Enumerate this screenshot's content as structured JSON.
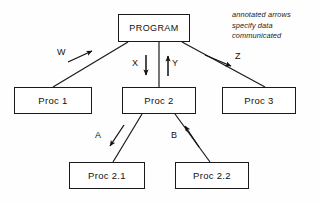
{
  "diagram": {
    "background_color": "#fefefe",
    "line_color": "#1a1a1a",
    "nodes": [
      {
        "id": "program",
        "label": "PROGRAM"
      },
      {
        "id": "proc1",
        "label": "Proc 1"
      },
      {
        "id": "proc2",
        "label": "Proc 2"
      },
      {
        "id": "proc3",
        "label": "Proc 3"
      },
      {
        "id": "proc21",
        "label": "Proc 2.1"
      },
      {
        "id": "proc22",
        "label": "Proc 2.2"
      }
    ],
    "edges": [
      {
        "id": "w",
        "label": "W",
        "from": "proc1",
        "to": "program",
        "direction": "up-right"
      },
      {
        "id": "x",
        "label": "X",
        "from": "program",
        "to": "proc2",
        "direction": "down"
      },
      {
        "id": "y",
        "label": "Y",
        "from": "proc2",
        "to": "program",
        "direction": "up"
      },
      {
        "id": "z",
        "label": "Z",
        "from": "program",
        "to": "proc3",
        "direction": "down-right"
      },
      {
        "id": "a",
        "label": "A",
        "from": "proc2",
        "to": "proc21",
        "direction": "down-left"
      },
      {
        "id": "b",
        "label": "B",
        "from": "proc22",
        "to": "proc2",
        "direction": "up-left"
      }
    ],
    "annotation": {
      "line1": "annotated arrows",
      "line2": "specify data",
      "line3": "communicated"
    }
  }
}
